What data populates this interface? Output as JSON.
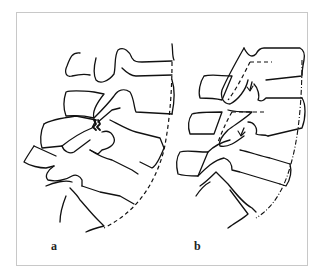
{
  "figure": {
    "panels": [
      {
        "label": "a",
        "description": "lumbar spine lateral view with fractured pars (spondylolysis) and posterior line"
      },
      {
        "label": "b",
        "description": "lumbar spine lateral view with dashed lines and arrows showing displacement along facets"
      }
    ],
    "colors": {
      "line": "#111111",
      "frame": "#c8c8c8",
      "background": "#ffffff"
    }
  }
}
